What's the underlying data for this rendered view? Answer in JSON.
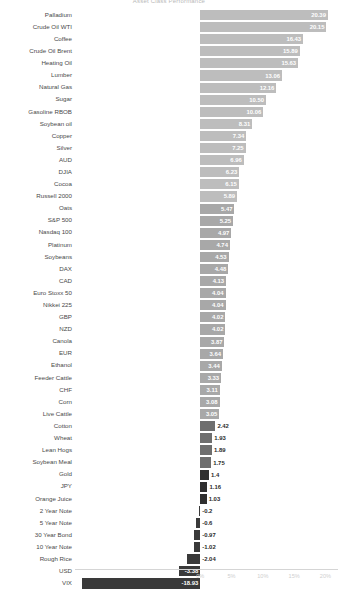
{
  "chart": {
    "title": "Asset Class Performance",
    "type": "bar",
    "orientation": "horizontal",
    "axis_origin_pct": 0,
    "colors": {
      "bar_high": "#bdbdbd",
      "bar_mid": "#a8a8a8",
      "bar_low": "#6e6e6e",
      "bar_dark": "#2f2f2f",
      "bar_negative": "#3a3a3a",
      "label_text": "#4a4a4a",
      "tick_text": "#cfcfcf",
      "value_inside": "#ffffff",
      "value_outside": "#2b2b2b"
    }
  },
  "chart_data": {
    "type": "bar",
    "title": "Asset Class Performance",
    "xlabel": "",
    "ylabel": "",
    "orientation": "horizontal",
    "xlim": [
      -20,
      22
    ],
    "xticks": [
      "0%",
      "5%",
      "10%",
      "15%",
      "20%"
    ],
    "xtick_values": [
      0,
      5,
      10,
      15,
      20
    ],
    "grid": false,
    "legend": "none",
    "categories": [
      "Palladium",
      "Crude Oil WTI",
      "Coffee",
      "Crude Oil Brent",
      "Heating Oil",
      "Lumber",
      "Natural Gas",
      "Sugar",
      "Gasoline RBOB",
      "Soybean oil",
      "Copper",
      "Silver",
      "AUD",
      "DJIA",
      "Cocoa",
      "Russell 2000",
      "Oats",
      "S&P 500",
      "Nasdaq 100",
      "Platinum",
      "Soybeans",
      "DAX",
      "CAD",
      "Euro Stoxx 50",
      "Nikkei 225",
      "GBP",
      "NZD",
      "Canola",
      "EUR",
      "Ethanol",
      "Feeder Cattle",
      "CHF",
      "Corn",
      "Live Cattle",
      "Cotton",
      "Wheat",
      "Lean Hogs",
      "Soybean Meal",
      "Gold",
      "JPY",
      "Orange Juice",
      "2 Year Note",
      "5 Year Note",
      "30 Year Bond",
      "10 Year Note",
      "Rough Rice",
      "USD",
      "VIX"
    ],
    "values": [
      20.39,
      20.15,
      16.43,
      15.89,
      15.63,
      13.06,
      12.16,
      10.5,
      10.06,
      8.31,
      7.34,
      7.25,
      6.96,
      6.23,
      6.15,
      5.89,
      5.47,
      5.25,
      4.97,
      4.74,
      4.53,
      4.48,
      4.13,
      4.04,
      4.04,
      4.02,
      4.02,
      3.87,
      3.64,
      3.44,
      3.33,
      3.11,
      3.08,
      3.05,
      2.42,
      1.93,
      1.89,
      1.75,
      1.4,
      1.16,
      1.03,
      -0.2,
      -0.6,
      -0.97,
      -1.02,
      -2.04,
      -3.38,
      -18.93
    ],
    "value_labels": [
      "20.39",
      "20.15",
      "16.43",
      "15.89",
      "15.63",
      "13.06",
      "12.16",
      "10.50",
      "10.06",
      "8.31",
      "7.34",
      "7.25",
      "6.96",
      "6.23",
      "6.15",
      "5.89",
      "5.47",
      "5.25",
      "4.97",
      "4.74",
      "4.53",
      "4.48",
      "4.13",
      "4.04",
      "4.04",
      "4.02",
      "4.02",
      "3.87",
      "3.64",
      "3.44",
      "3.33",
      "3.11",
      "3.08",
      "3.05",
      "2.42",
      "1.93",
      "1.89",
      "1.75",
      "1.4",
      "1.16",
      "1.03",
      "-0.2",
      "-0.6",
      "-0.97",
      "-1.02",
      "-2.04",
      "-3.38",
      "-18.93"
    ]
  }
}
